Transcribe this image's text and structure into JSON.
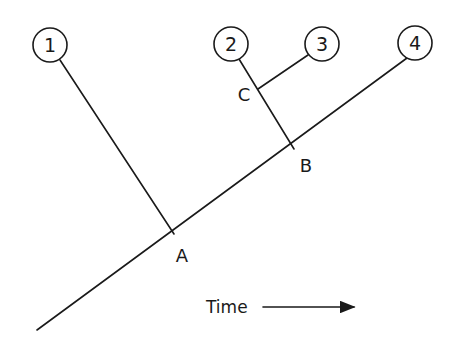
{
  "diagram": {
    "type": "phylogenetic-tree",
    "tips": [
      {
        "id": "1",
        "label": "1",
        "cx": 50,
        "cy": 45
      },
      {
        "id": "2",
        "label": "2",
        "cx": 231,
        "cy": 44
      },
      {
        "id": "3",
        "label": "3",
        "cx": 322,
        "cy": 44
      },
      {
        "id": "4",
        "label": "4",
        "cx": 415,
        "cy": 43
      }
    ],
    "nodes": [
      {
        "id": "A",
        "label": "A",
        "x": 174,
        "y": 234
      },
      {
        "id": "B",
        "label": "B",
        "x": 294,
        "y": 149
      },
      {
        "id": "C",
        "label": "C",
        "x": 258,
        "y": 89
      }
    ],
    "axis": {
      "label": "Time",
      "direction": "right"
    },
    "colors": {
      "stroke": "#1a1a1a",
      "background": "#ffffff"
    }
  }
}
